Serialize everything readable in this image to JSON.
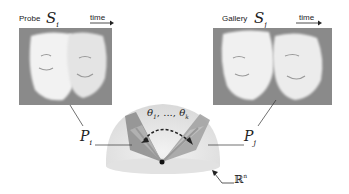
{
  "probe": {
    "label": "Probe",
    "set_symbol": "S",
    "set_subscript": "i",
    "time_label": "time",
    "subspace_symbol": "P",
    "subspace_subscript": "i"
  },
  "gallery": {
    "label": "Gallery",
    "set_symbol": "S",
    "set_subscript": "j",
    "time_label": "time",
    "subspace_symbol": "P",
    "subspace_subscript": "j"
  },
  "manifold": {
    "angles_label": "θ",
    "angles_sub_first": "1",
    "angles_sep": ", ..., ",
    "angles_sub_last": "k",
    "space_symbol": "ℝ",
    "space_superscript": "n"
  },
  "colors": {
    "panel_bg": "#8a8a8a",
    "hemisphere": "#e6e6e6",
    "plane_left": "#8f8f8f",
    "plane_right": "#a3a3a3",
    "arrow": "#222222"
  }
}
